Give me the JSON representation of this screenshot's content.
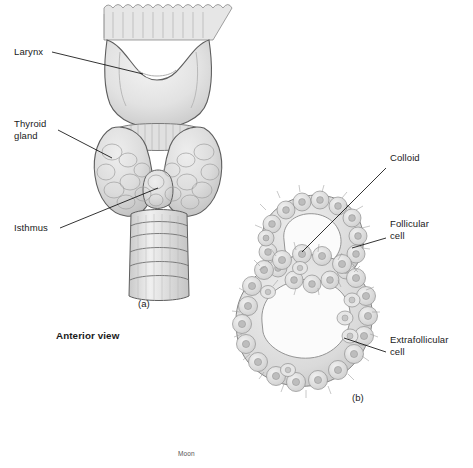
{
  "figure": {
    "background": "#ffffff",
    "ink": "#1a1a1a",
    "panels": [
      {
        "id": "a",
        "caption": "(a)",
        "sub_caption": "Anterior view"
      },
      {
        "id": "b",
        "caption": "(b)"
      }
    ],
    "labels": [
      {
        "name": "larynx",
        "text": "Larynx"
      },
      {
        "name": "thyroid-gland",
        "text": "Thyroid\ngland"
      },
      {
        "name": "isthmus",
        "text": "Isthmus"
      },
      {
        "name": "colloid",
        "text": "Colloid"
      },
      {
        "name": "follicular-cell",
        "text": "Follicular\ncell"
      },
      {
        "name": "extrafollicular-cell",
        "text": "Extrafollicular\ncell"
      }
    ],
    "credit": "Moon",
    "colors": {
      "line": "#000000",
      "fill_light": "#e8e8e8",
      "fill_mid": "#d2d2d2",
      "fill_dark": "#bdbdbd",
      "outline": "#6b6b6b"
    }
  }
}
